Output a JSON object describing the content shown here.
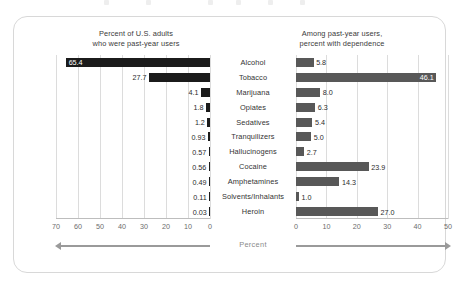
{
  "chart_data": {
    "type": "bar",
    "title": "",
    "layout": "diverging-paired-horizontal-bars",
    "categories": [
      "Alcohol",
      "Tobacco",
      "Marijuana",
      "Opiates",
      "Sedatives",
      "Tranquilizers",
      "Hallucinogens",
      "Cocaine",
      "Amphetamines",
      "Solvents/Inhalants",
      "Heroin"
    ],
    "xlabel": "Percent",
    "grid": true,
    "legend": "none",
    "series": [
      {
        "name": "Percent of U.S. adults who were past-year users",
        "side": "left",
        "direction": "right-to-left",
        "xlim": [
          0,
          70
        ],
        "ticks": [
          70,
          60,
          50,
          40,
          30,
          20,
          10,
          0
        ],
        "color": "#1b1b1b",
        "values": [
          65.4,
          27.7,
          4.1,
          1.8,
          1.2,
          0.93,
          0.57,
          0.56,
          0.49,
          0.11,
          0.03
        ],
        "labels": [
          "65.4",
          "27.7",
          "4.1",
          "1.8",
          "1.2",
          "0.93",
          "0.57",
          "0.56",
          "0.49",
          "0.11",
          "0.03"
        ],
        "label_inside": [
          true,
          false,
          false,
          false,
          false,
          false,
          false,
          false,
          false,
          false,
          false
        ]
      },
      {
        "name": "Among past-year users, percent with dependence",
        "side": "right",
        "direction": "left-to-right",
        "xlim": [
          0,
          50
        ],
        "ticks": [
          0,
          10,
          20,
          30,
          40,
          50
        ],
        "color": "#585858",
        "values": [
          5.8,
          46.1,
          8.0,
          6.3,
          5.4,
          5.0,
          2.7,
          23.9,
          14.3,
          1.0,
          27.0
        ],
        "labels": [
          "5.8",
          "46.1",
          "8.0",
          "6.3",
          "5.4",
          "5.0",
          "2.7",
          "23.9",
          "14.3",
          "1.0",
          "27.0"
        ],
        "label_inside": [
          false,
          true,
          false,
          false,
          false,
          false,
          false,
          false,
          false,
          false,
          false
        ]
      }
    ]
  },
  "panels": {
    "left": {
      "title_line1": "Percent of U.S. adults",
      "title_line2": "who were past-year users"
    },
    "right": {
      "title_line1": "Among past-year users,",
      "title_line2": "percent with dependence"
    }
  },
  "axis": {
    "percent_label": "Percent"
  },
  "colors": {
    "left_bar": "#1b1b1b",
    "right_bar": "#585858",
    "gridline": "#dcdcdc",
    "axis_line": "#bdbdbd",
    "card_border": "#d8d8d8",
    "arrow": "#9a9a9a",
    "label_text": "#2b2b2b",
    "tick_text": "#6d6d6d",
    "title_text": "#3a3a3a",
    "background": "#ffffff"
  }
}
